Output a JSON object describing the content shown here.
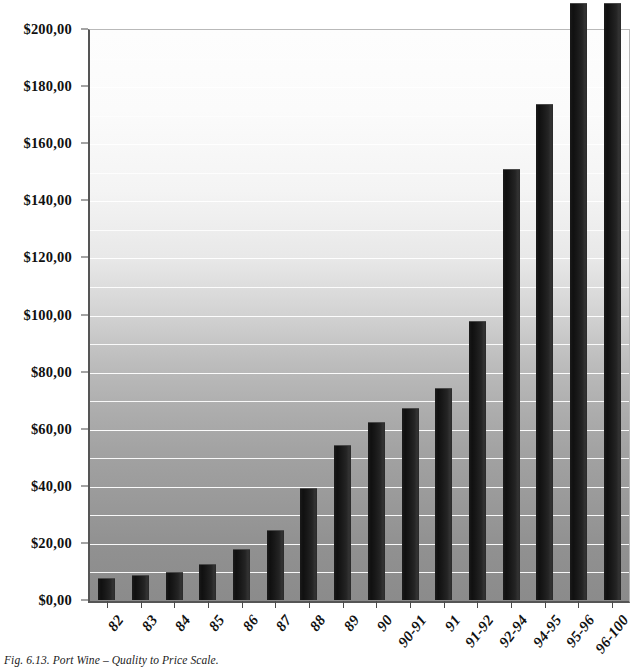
{
  "caption": "Fig. 6.13. Port Wine – Quality to Price Scale.",
  "colors": {
    "bar": "#151515",
    "gridline": "#ffffff",
    "axis": "#4a4a4a",
    "background_top": "#fdfdfd",
    "background_bottom": "#8b8b8b"
  },
  "chart_data": {
    "type": "bar",
    "title": "Fig. 6.13. Port Wine – Quality to Price Scale.",
    "xlabel": "",
    "ylabel": "",
    "ylim": [
      0,
      200
    ],
    "ytick_step": 20,
    "gridline_step": 10,
    "grid": true,
    "legend": false,
    "currency_symbol": "$",
    "decimal_separator": ",",
    "categories": [
      "82",
      "83",
      "84",
      "85",
      "86",
      "87",
      "88",
      "89",
      "90",
      "90-91",
      "91",
      "91-92",
      "92-94",
      "94-95",
      "95-96",
      "96-100"
    ],
    "values": [
      7.7,
      8.6,
      9.8,
      12.6,
      17.8,
      24.5,
      39.3,
      54.3,
      62.4,
      67.4,
      74.2,
      97.8,
      151.0,
      173.8,
      209.0,
      209.0
    ],
    "ytick_labels": [
      "$0,00",
      "$20,00",
      "$40,00",
      "$60,00",
      "$80,00",
      "$100,00",
      "$120,00",
      "$140,00",
      "$160,00",
      "$180,00",
      "$200,00"
    ],
    "ytick_values": [
      0,
      20,
      40,
      60,
      80,
      100,
      120,
      140,
      160,
      180,
      200
    ]
  }
}
